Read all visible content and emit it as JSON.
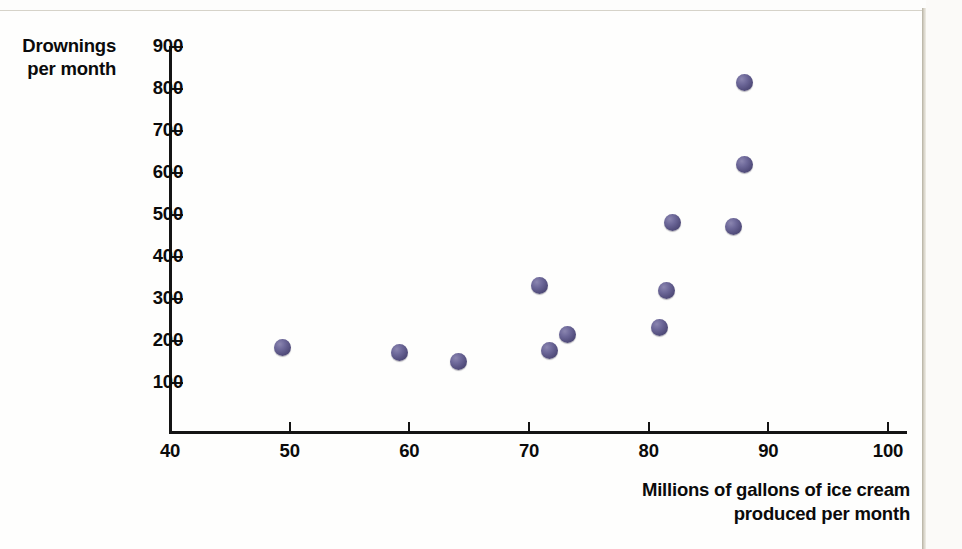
{
  "chart_data": {
    "type": "scatter",
    "title": "",
    "xlabel": "Millions of gallons of ice cream produced per month",
    "ylabel": "Drownings per month",
    "xlabel_lines": [
      "Millions of gallons of ice cream",
      "produced per month"
    ],
    "ylabel_lines": [
      "Drownings",
      "per month"
    ],
    "xlim": [
      40,
      100
    ],
    "ylim": [
      0,
      900
    ],
    "xticks": [
      40,
      50,
      60,
      70,
      80,
      90,
      100
    ],
    "yticks": [
      100,
      200,
      300,
      400,
      500,
      600,
      700,
      800,
      900
    ],
    "xtick_labels": [
      "40",
      "50",
      "60",
      "70",
      "80",
      "90",
      "100"
    ],
    "ytick_labels": [
      "100",
      "200",
      "300",
      "400",
      "500",
      "600",
      "700",
      "800",
      "900"
    ],
    "grid": false,
    "legend": null,
    "marker_color": "#5f5a8c",
    "points": [
      {
        "x": 49.4,
        "y": 185
      },
      {
        "x": 59.2,
        "y": 172
      },
      {
        "x": 64.1,
        "y": 152
      },
      {
        "x": 70.9,
        "y": 332
      },
      {
        "x": 71.7,
        "y": 178
      },
      {
        "x": 73.2,
        "y": 216
      },
      {
        "x": 80.9,
        "y": 232
      },
      {
        "x": 81.5,
        "y": 320
      },
      {
        "x": 82.0,
        "y": 482
      },
      {
        "x": 87.1,
        "y": 472
      },
      {
        "x": 88.0,
        "y": 620
      },
      {
        "x": 88.0,
        "y": 815
      }
    ]
  },
  "colors": {
    "marker": "#5f5a8c",
    "axis": "#141414",
    "text": "#0b0b0b",
    "page": "#fdfdfc",
    "scan_edge": "#b5b0a1"
  }
}
